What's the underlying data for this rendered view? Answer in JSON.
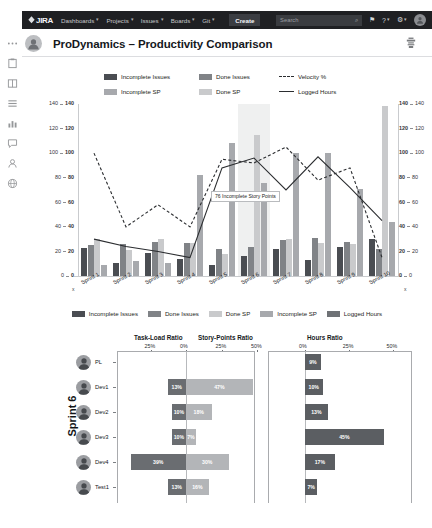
{
  "nav": {
    "logo": "JIRA",
    "items": [
      {
        "label": "Dashboards",
        "caret": "▾"
      },
      {
        "label": "Projects",
        "caret": "▾"
      },
      {
        "label": "Issues",
        "caret": "▾"
      },
      {
        "label": "Boards",
        "caret": "▾"
      },
      {
        "label": "Git",
        "caret": "▾"
      }
    ],
    "create_label": "Create",
    "search_placeholder": "Search",
    "search_icon": "⌕",
    "notifications_icon": "⚑",
    "help_icon": "?",
    "settings_icon": "⚙",
    "caret": "▾"
  },
  "header": {
    "title": "ProDynamics – Productivity Comparison"
  },
  "legend_top": [
    {
      "label": "Incomplete Issues",
      "type": "swatch",
      "color": "#4a4d52"
    },
    {
      "label": "Done Issues",
      "type": "swatch",
      "color": "#808387"
    },
    {
      "label": "Velocity %",
      "type": "dash",
      "color": "#2b2d30"
    },
    {
      "label": "Incomplete SP",
      "type": "swatch",
      "color": "#a7a9ad"
    },
    {
      "label": "Done SP",
      "type": "swatch",
      "color": "#c9cacc"
    },
    {
      "label": "Logged Hours",
      "type": "line",
      "color": "#2b2d30"
    }
  ],
  "legend_bottom": [
    {
      "label": "Incomplete Issues",
      "color": "#4a4d52"
    },
    {
      "label": "Done Issues",
      "color": "#808387"
    },
    {
      "label": "Done SP",
      "color": "#c9cacc"
    },
    {
      "label": "Incomplete SP",
      "color": "#a7a9ad"
    },
    {
      "label": "Logged Hours",
      "color": "#6f7276"
    }
  ],
  "tooltip": {
    "text": "76 Incomplete Story Points"
  },
  "chart_data": {
    "type": "bar",
    "title": "ProDynamics – Productivity Comparison",
    "xlabel": "",
    "ylabel": "",
    "ylim": [
      0,
      140
    ],
    "y2lim": [
      0,
      140
    ],
    "yticks": [
      0,
      20,
      40,
      60,
      80,
      100,
      120,
      140
    ],
    "y2ticks": [
      0,
      20,
      40,
      60,
      80,
      100,
      120,
      140
    ],
    "grid": false,
    "legend_position": "top",
    "categories": [
      "Sprint 1",
      "Sprint 2",
      "Sprint 3",
      "Sprint 4",
      "Sprint 5",
      "Sprint 6",
      "Sprint 7",
      "Sprint 8",
      "Sprint 9",
      "Sprint 10"
    ],
    "series": [
      {
        "name": "Incomplete Issues",
        "type": "bar",
        "color": "#4a4d52",
        "values": [
          23,
          11,
          19,
          14,
          9,
          16,
          22,
          13,
          24,
          30
        ]
      },
      {
        "name": "Done Issues",
        "type": "bar",
        "color": "#808387",
        "values": [
          25,
          26,
          28,
          27,
          22,
          24,
          29,
          31,
          28,
          22
        ]
      },
      {
        "name": "Done SP",
        "type": "bar",
        "color": "#c9cacc",
        "values": [
          30,
          21,
          30,
          27,
          18,
          115,
          30,
          27,
          26,
          138
        ]
      },
      {
        "name": "Incomplete SP",
        "type": "bar",
        "color": "#a7a9ad",
        "values": [
          9,
          12,
          11,
          82,
          108,
          76,
          100,
          100,
          71,
          44
        ]
      },
      {
        "name": "Logged Hours",
        "type": "line",
        "color": "#2b2d30",
        "values": [
          30,
          24,
          20,
          15,
          88,
          96,
          70,
          97,
          72,
          45
        ]
      },
      {
        "name": "Velocity %",
        "type": "dashed-line",
        "color": "#2b2d30",
        "values": [
          100,
          40,
          58,
          40,
          95,
          92,
          105,
          78,
          88,
          15
        ]
      }
    ]
  },
  "lower": {
    "sprint_label": "Sprint 6",
    "panels": [
      {
        "title": "Task-Load Ratio",
        "ticks": [
          "25%",
          "0%"
        ]
      },
      {
        "title": "Story-Points Ratio",
        "ticks": [
          "25%",
          "50%"
        ]
      },
      {
        "title": "Hours Ratio",
        "ticks": [
          "0%",
          "25%",
          "50%"
        ]
      }
    ],
    "rows": [
      {
        "name": "PL",
        "task_load": null,
        "story_points": null,
        "hours": "9%",
        "task_load_val": 0,
        "story_points_val": 0,
        "hours_val": 9
      },
      {
        "name": "Dev1",
        "task_load": "13%",
        "story_points": "47%",
        "hours": "10%",
        "task_load_val": 13,
        "story_points_val": 47,
        "hours_val": 10
      },
      {
        "name": "Dev2",
        "task_load": "10%",
        "story_points": "18%",
        "hours": "13%",
        "task_load_val": 10,
        "story_points_val": 18,
        "hours_val": 13
      },
      {
        "name": "Dev3",
        "task_load": "10%",
        "story_points": "7%",
        "hours": "45%",
        "task_load_val": 10,
        "story_points_val": 7,
        "hours_val": 45
      },
      {
        "name": "Dev4",
        "task_load": "39%",
        "story_points": "30%",
        "hours": "17%",
        "task_load_val": 39,
        "story_points_val": 30,
        "hours_val": 17
      },
      {
        "name": "Test1",
        "task_load": "13%",
        "story_points": "16%",
        "hours": "7%",
        "task_load_val": 13,
        "story_points_val": 16,
        "hours_val": 7
      }
    ]
  }
}
